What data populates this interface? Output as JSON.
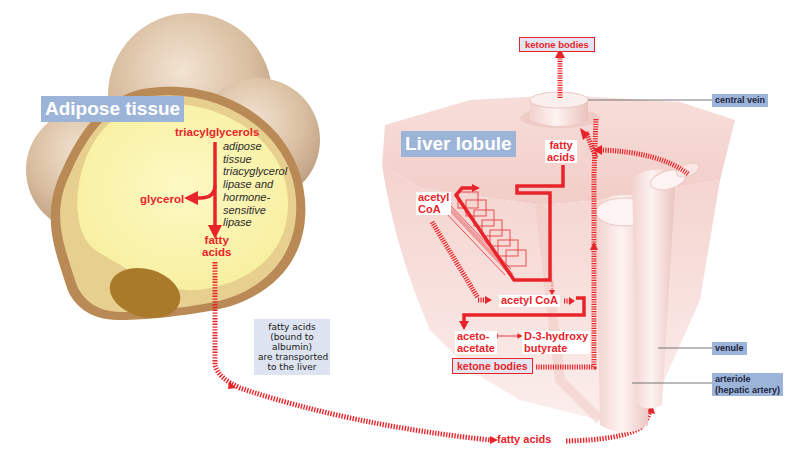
{
  "adipose": {
    "title": "Adipose tissue",
    "substrate": "triacylglycerols",
    "enzyme": "adipose\ntissue\ntriacyglycerol\nlipase and\nhormone-\nsensitive\nlipase",
    "product_left": "glycerol",
    "product_bottom": "fatty\nacids"
  },
  "transport_note": "fatty acids\n(bound to\nalbumin)\nare transported\nto the liver",
  "bloodstream_label": "fatty acids",
  "liver": {
    "title": "Liver lobule",
    "ketone_bodies_top": "ketone bodies",
    "fatty_acids": "fatty\nacids",
    "acetyl_coa_cycle": "acetyl\nCoA",
    "acetyl_coa": "acetyl CoA",
    "acetoacetate": "aceto-\nacetate",
    "hydroxybutyrate": "D-3-hydroxy\nbutyrate",
    "ketone_bodies_bottom": "ketone bodies"
  },
  "callouts": {
    "central_vein": "central vein",
    "venule": "venule",
    "arteriole": "arteriole\n(hepatic artery)"
  },
  "colors": {
    "pathway_red": "#e8242a",
    "label_blue": "#9cb4d8",
    "cell_yellow": "#fbf6b0",
    "cell_membrane": "#b98a55",
    "nucleus": "#a97a2a",
    "liver_pink": "#f6dcd8"
  }
}
